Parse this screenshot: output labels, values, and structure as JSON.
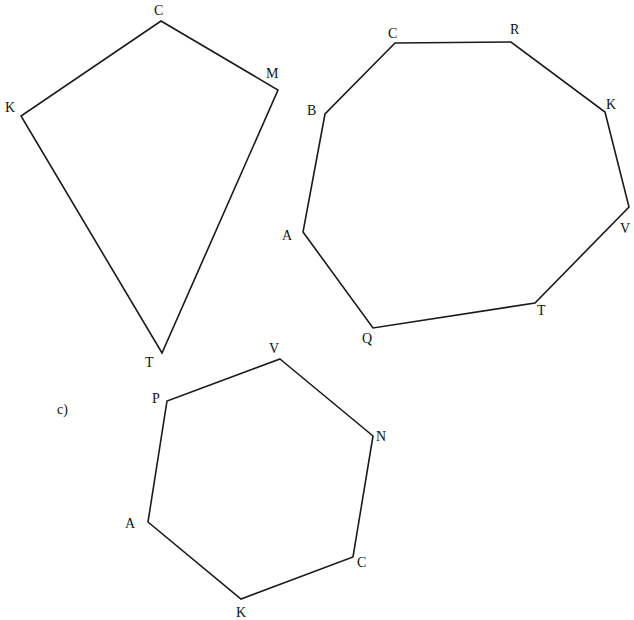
{
  "figure": {
    "background": "#ffffff",
    "stroke_color": "#1a1a1a",
    "shapes": [
      {
        "id": "kite",
        "name": "quadrilateral KCMT",
        "part_label": "",
        "vertices": [
          {
            "label": "C",
            "x": 161,
            "y": 21,
            "lx": 154,
            "ly": 15
          },
          {
            "label": "M",
            "x": 278,
            "y": 90,
            "lx": 266,
            "ly": 78
          },
          {
            "label": "T",
            "x": 162,
            "y": 353,
            "lx": 145,
            "ly": 367
          },
          {
            "label": "K",
            "x": 21,
            "y": 116,
            "lx": 5,
            "ly": 112
          }
        ]
      },
      {
        "id": "octagon",
        "name": "octagon CRKVTQAB",
        "part_label": "",
        "vertices": [
          {
            "label": "C",
            "x": 395,
            "y": 43,
            "lx": 388,
            "ly": 38
          },
          {
            "label": "R",
            "x": 511,
            "y": 42,
            "lx": 510,
            "ly": 34
          },
          {
            "label": "K",
            "x": 605,
            "y": 112,
            "lx": 606,
            "ly": 109
          },
          {
            "label": "V",
            "x": 629,
            "y": 207,
            "lx": 620,
            "ly": 233
          },
          {
            "label": "T",
            "x": 535,
            "y": 303,
            "lx": 537,
            "ly": 315
          },
          {
            "label": "Q",
            "x": 373,
            "y": 328,
            "lx": 362,
            "ly": 343
          },
          {
            "label": "A",
            "x": 303,
            "y": 232,
            "lx": 282,
            "ly": 240
          },
          {
            "label": "B",
            "x": 325,
            "y": 114,
            "lx": 307,
            "ly": 115
          }
        ]
      },
      {
        "id": "hexagon",
        "name": "hexagon PVNCKA",
        "part_label": "c)",
        "part_label_pos": {
          "x": 57,
          "y": 414
        },
        "vertices": [
          {
            "label": "V",
            "x": 280,
            "y": 359,
            "lx": 269,
            "ly": 353
          },
          {
            "label": "N",
            "x": 373,
            "y": 436,
            "lx": 376,
            "ly": 441
          },
          {
            "label": "C",
            "x": 353,
            "y": 557,
            "lx": 357,
            "ly": 567
          },
          {
            "label": "K",
            "x": 241,
            "y": 599,
            "lx": 236,
            "ly": 617
          },
          {
            "label": "A",
            "x": 148,
            "y": 522,
            "lx": 125,
            "ly": 528
          },
          {
            "label": "P",
            "x": 167,
            "y": 401,
            "lx": 152,
            "ly": 403
          }
        ]
      }
    ]
  }
}
